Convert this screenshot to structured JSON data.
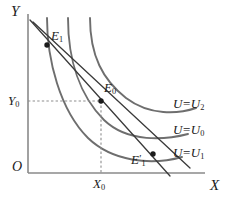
{
  "figure": {
    "kind": "indifference-curve-diagram",
    "width": 228,
    "height": 200,
    "background": "#ffffff"
  },
  "axes": {
    "y_axis_label": "Y",
    "x_axis_label": "X",
    "origin_label": "O",
    "y_axis_x": 28,
    "x_axis_y": 173,
    "y_axis_top": 14,
    "x_axis_right": 205
  },
  "ticks": {
    "y0": {
      "label": "Y",
      "sub": "0",
      "value_y": 101
    },
    "x0": {
      "label": "X",
      "sub": "0",
      "value_x": 101
    }
  },
  "points": [
    {
      "id": "E1",
      "label": "E",
      "sub": "1",
      "prime": "",
      "x": 47,
      "y": 45
    },
    {
      "id": "E0",
      "label": "E",
      "sub": "0",
      "prime": "",
      "x": 101,
      "y": 101
    },
    {
      "id": "E1p",
      "label": "E",
      "sub": "1",
      "prime": "′",
      "x": 153,
      "y": 154
    }
  ],
  "curves": [
    {
      "id": "U1",
      "label_lhs": "U",
      "label_eq": "=",
      "label_rhs": "U",
      "label_sub": "1",
      "color": "#6e6e6e",
      "path": "M 47,18 C 47,60 60,110 88,138 C 112,161 150,166 182,157"
    },
    {
      "id": "U0",
      "label_lhs": "U",
      "label_eq": "=",
      "label_rhs": "U",
      "label_sub": "0",
      "color": "#6e6e6e",
      "path": "M 68,18 C 68,60 80,96 104,120 C 128,143 165,140 188,134"
    },
    {
      "id": "U2",
      "label_lhs": "U",
      "label_eq": "=",
      "label_rhs": "U",
      "label_sub": "2",
      "color": "#6e6e6e",
      "path": "M 90,18 C 90,56 103,80 126,98 C 150,116 178,114 196,108"
    }
  ],
  "budget_lines": [
    {
      "id": "budget-original",
      "x1": 30,
      "y1": 20,
      "x2": 170,
      "y2": 176
    },
    {
      "id": "budget-compensated",
      "x1": 33,
      "y1": 22,
      "x2": 190,
      "y2": 168
    }
  ],
  "guides": [
    {
      "id": "guide-horizontal-y0",
      "x1": 28,
      "y1": 101,
      "x2": 101,
      "y2": 101
    },
    {
      "id": "guide-vertical-x0",
      "x1": 101,
      "y1": 101,
      "x2": 101,
      "y2": 173
    }
  ],
  "colors": {
    "axis": "#8a8a8a",
    "curve": "#6e6e6e",
    "budget": "#3a3a3a",
    "guide": "#8d8d8d",
    "point": "#1c1c1c",
    "text": "#1b1b1b"
  }
}
